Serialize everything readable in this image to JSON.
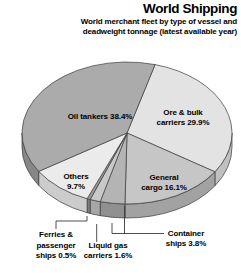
{
  "header": {
    "title": "World Shipping",
    "subtitle_line1": "World merchant fleet by type of vessel and",
    "subtitle_line2": "deadweight tonnage (latest available year)"
  },
  "chart_data": {
    "type": "pie",
    "title": "World Shipping",
    "subtitle": "World merchant fleet by type of vessel and deadweight tonnage (latest available year)",
    "style": "3d-pie-grayscale",
    "start_angle_deg": 74.5,
    "direction": "clockwise",
    "outline_color": "#3b3b3b",
    "slices": [
      {
        "label": "Ore & bulk carriers",
        "value": 29.9,
        "display_label": "Ore & bulk\ncarriers 29.9%",
        "color": "#e3e3e3",
        "side_color": "#c0c0c0"
      },
      {
        "label": "General cargo",
        "value": 16.1,
        "display_label": "General\ncargo 16.1%",
        "color": "#c6c6c6",
        "side_color": "#a2a2a2"
      },
      {
        "label": "Container ships",
        "value": 3.8,
        "display_label": "Container\nships 3.8%",
        "color": "#b4b4b4",
        "side_color": "#909090"
      },
      {
        "label": "Liquid gas carriers",
        "value": 1.6,
        "display_label": "Liquid gas\ncarriers 1.6%",
        "color": "#c9c9c9",
        "side_color": "#a6a6a6"
      },
      {
        "label": "Ferries & passenger ships",
        "value": 0.5,
        "display_label": "Ferries &\npassenger\nships 0.5%",
        "color": "#9b9b9b",
        "side_color": "#7d7d7d"
      },
      {
        "label": "Others",
        "value": 9.7,
        "display_label": "Others\n9.7%",
        "color": "#ebebeb",
        "side_color": "#cccccc"
      },
      {
        "label": "Oil tankers",
        "value": 38.4,
        "display_label": "Oil tankers 38.4%",
        "color": "#ababab",
        "side_color": "#878787"
      }
    ]
  }
}
